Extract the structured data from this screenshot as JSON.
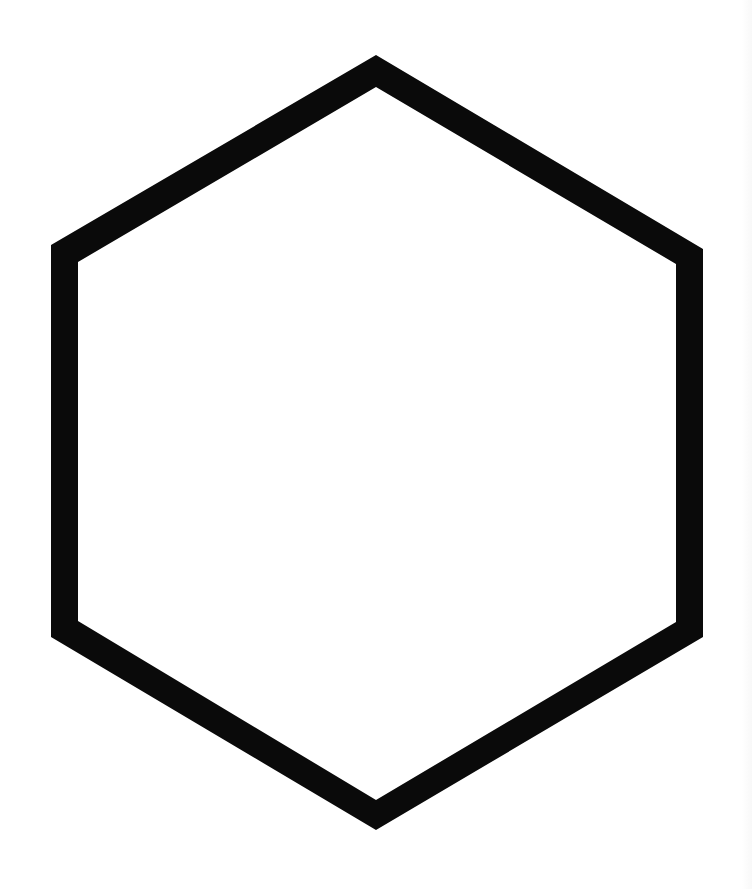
{
  "diagram": {
    "shape": "hexagon",
    "style": "outline",
    "stroke_color": "#0a0a0a",
    "fill_color": "#ffffff",
    "background_color": "#ffffff",
    "outer_vertices": [
      [
        376,
        55
      ],
      [
        703,
        249
      ],
      [
        703,
        637
      ],
      [
        376,
        830
      ],
      [
        51,
        637
      ],
      [
        51,
        245
      ]
    ],
    "inner_vertices": [
      [
        376,
        87
      ],
      [
        676,
        264
      ],
      [
        676,
        622
      ],
      [
        376,
        800
      ],
      [
        78,
        621
      ],
      [
        78,
        262
      ]
    ]
  }
}
